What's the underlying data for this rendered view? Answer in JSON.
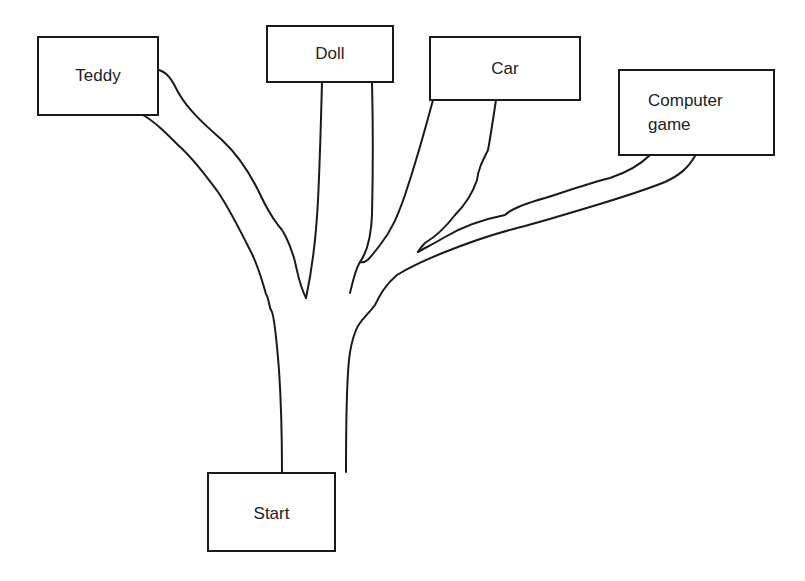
{
  "diagram": {
    "type": "tree-branches",
    "root": {
      "id": "start",
      "label": "Start"
    },
    "branches": [
      {
        "id": "teddy",
        "label": "Teddy"
      },
      {
        "id": "doll",
        "label": "Doll"
      },
      {
        "id": "car",
        "label": "Car"
      },
      {
        "id": "computer_game",
        "label": "Computer game",
        "lines": [
          "Computer",
          "game"
        ]
      }
    ],
    "edges": [
      {
        "from": "start",
        "to": "teddy"
      },
      {
        "from": "start",
        "to": "doll"
      },
      {
        "from": "start",
        "to": "car"
      },
      {
        "from": "start",
        "to": "computer_game"
      }
    ],
    "colors": {
      "stroke": "#1a1a1a",
      "background": "#ffffff",
      "text": "#222222"
    }
  }
}
